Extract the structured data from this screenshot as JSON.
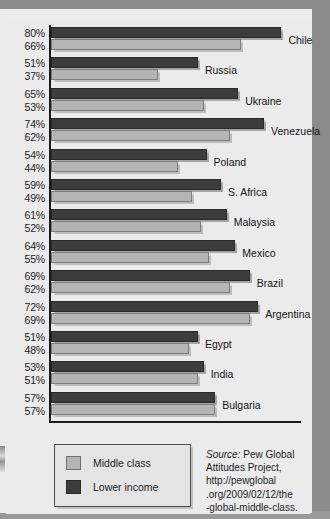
{
  "chart_data": {
    "type": "bar",
    "orientation": "horizontal",
    "title": "",
    "xlabel": "",
    "ylabel": "",
    "xlim": [
      0,
      100
    ],
    "grid": false,
    "legend_position": "bottom-left",
    "categories": [
      "Chile",
      "Russia",
      "Ukraine",
      "Venezuela",
      "Poland",
      "S. Africa",
      "Malaysia",
      "Mexico",
      "Brazil",
      "Argentina",
      "Egypt",
      "India",
      "Bulgaria"
    ],
    "series": [
      {
        "name": "Lower income",
        "color": "#3c3c3c",
        "values": [
          80,
          51,
          65,
          74,
          54,
          59,
          61,
          64,
          69,
          72,
          51,
          53,
          57
        ]
      },
      {
        "name": "Middle class",
        "color": "#b4b4b4",
        "values": [
          66,
          37,
          53,
          62,
          44,
          49,
          52,
          55,
          62,
          69,
          48,
          51,
          57
        ]
      }
    ],
    "value_labels": [
      [
        "80%",
        "66%"
      ],
      [
        "51%",
        "37%"
      ],
      [
        "65%",
        "53%"
      ],
      [
        "74%",
        "62%"
      ],
      [
        "54%",
        "44%"
      ],
      [
        "59%",
        "49%"
      ],
      [
        "61%",
        "52%"
      ],
      [
        "64%",
        "55%"
      ],
      [
        "69%",
        "62%"
      ],
      [
        "72%",
        "69%"
      ],
      [
        "51%",
        "48%"
      ],
      [
        "53%",
        "51%"
      ],
      [
        "57%",
        "57%"
      ]
    ],
    "annotations": []
  },
  "legend": {
    "items": [
      {
        "label": "Middle class",
        "color": "#b4b4b4"
      },
      {
        "label": "Lower income",
        "color": "#3c3c3c"
      }
    ]
  },
  "source": {
    "prefix": "Source:",
    "line1": " Pew Global",
    "line2": "Attitudes Project,",
    "line3": "http://pewglobal",
    "line4": ".org/2009/02/12/the",
    "line5": "-global-middle-class."
  }
}
